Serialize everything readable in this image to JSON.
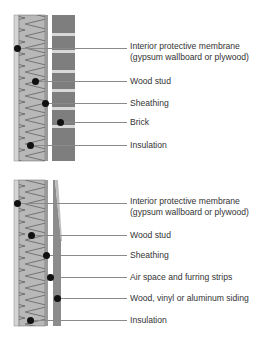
{
  "colors": {
    "gypsum": "#d0d0d0",
    "insulation": "#b8b8b8",
    "sheathing": "#9a9a9a",
    "brick": "#7e7e7e",
    "mortar": "#d8d8d8",
    "siding": "#8c8c8c",
    "leader": "#8a8a8a"
  },
  "diagrams": [
    {
      "name": "brick-veneer-wall",
      "labels": [
        {
          "text": "Interior protective membrane\n(gypsum wallboard or plywood)",
          "line1": "Interior protective membrane",
          "line2": "(gypsum wallboard or plywood)"
        },
        {
          "text": "Wood stud"
        },
        {
          "text": "Sheathing"
        },
        {
          "text": "Brick"
        },
        {
          "text": "Insulation"
        }
      ]
    },
    {
      "name": "siding-wall",
      "labels": [
        {
          "text": "Interior protective membrane\n(gypsum wallboard or plywood)",
          "line1": "Interior protective membrane",
          "line2": "(gypsum wallboard or plywood)"
        },
        {
          "text": "Wood stud"
        },
        {
          "text": "Sheathing"
        },
        {
          "text": "Air space and furring strips"
        },
        {
          "text": "Wood, vinyl or aluminum siding"
        },
        {
          "text": "Insulation"
        }
      ]
    }
  ]
}
